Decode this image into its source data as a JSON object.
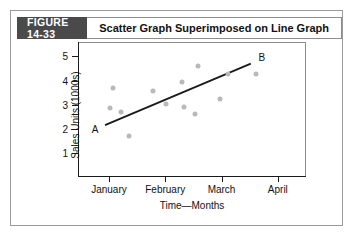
{
  "figure": {
    "label": "FIGURE 14-33",
    "title": "Scatter Graph Superimposed on Line Graph"
  },
  "colors": {
    "badge_bg": "#4a4a4a",
    "dot": "#b9b9b9",
    "line": "#1a1a1a",
    "frame": "#8c8c8c"
  },
  "chart_data": {
    "type": "scatter",
    "title": "Scatter Graph Superimposed on Line Graph",
    "xlabel": "Time—Months",
    "ylabel": "Sales Units (1000s)",
    "categories": [
      "January",
      "February",
      "March",
      "April"
    ],
    "category_x": [
      1,
      2,
      3,
      4
    ],
    "xlim": [
      0.45,
      4.5
    ],
    "ylim": [
      0,
      5.6
    ],
    "yticks": [
      1,
      2,
      3,
      4,
      5
    ],
    "ytick_labels": [
      "1",
      "2",
      "3",
      "4",
      "5"
    ],
    "grid": false,
    "legend": "none",
    "points": [
      {
        "x": 1.02,
        "y": 2.86
      },
      {
        "x": 1.08,
        "y": 3.68
      },
      {
        "x": 1.22,
        "y": 2.68
      },
      {
        "x": 1.35,
        "y": 1.72
      },
      {
        "x": 1.78,
        "y": 3.58
      },
      {
        "x": 2.02,
        "y": 3.04
      },
      {
        "x": 2.3,
        "y": 3.93
      },
      {
        "x": 2.33,
        "y": 2.91
      },
      {
        "x": 2.52,
        "y": 2.62
      },
      {
        "x": 2.58,
        "y": 4.62
      },
      {
        "x": 2.98,
        "y": 3.25
      },
      {
        "x": 3.11,
        "y": 4.27
      },
      {
        "x": 3.62,
        "y": 4.27
      }
    ],
    "trend_line": {
      "start": {
        "x": 0.93,
        "y": 2.15,
        "label": "A"
      },
      "end": {
        "x": 3.52,
        "y": 4.7,
        "label": "B"
      }
    }
  }
}
